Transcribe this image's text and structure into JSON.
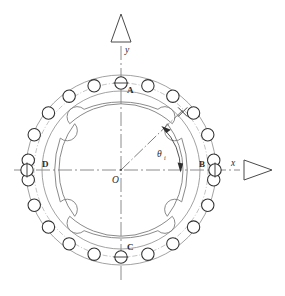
{
  "diagram": {
    "axes": {
      "x_label": "x",
      "y_label": "y",
      "origin_label": "O"
    },
    "angle": {
      "symbol": "θ",
      "subscript": "i",
      "from_axis": "x",
      "value_deg": 45
    },
    "station_labels": [
      {
        "name": "A",
        "position": "top"
      },
      {
        "name": "B",
        "position": "right"
      },
      {
        "name": "C",
        "position": "bottom"
      },
      {
        "name": "D",
        "position": "left"
      }
    ],
    "geometry": {
      "center_x": 121,
      "center_y": 170,
      "outer_ring_radius": 95,
      "inner_ring_radius": 79,
      "ball_pitch_radius": 87,
      "ball_radius": 6.2,
      "ball_count": 20,
      "segment_count": 4,
      "balls_per_segment": 5,
      "ball_start_angle_deg": 90,
      "ball_step_deg": 18
    },
    "colors": {
      "line": "#3a3a3a",
      "light_line": "#8d8d8d",
      "background": "#ffffff",
      "text": "#2b2b2b"
    }
  }
}
